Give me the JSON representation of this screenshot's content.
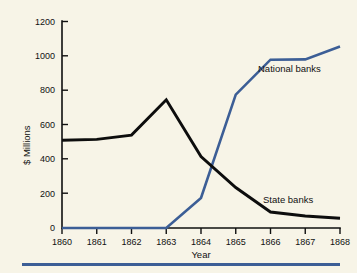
{
  "chart_data": {
    "type": "line",
    "title": "",
    "xlabel": "Year",
    "ylabel": "$ Millions",
    "categories": [
      "1860",
      "1861",
      "1862",
      "1863",
      "1864",
      "1865",
      "1866",
      "1867",
      "1868"
    ],
    "x": [
      1860,
      1861,
      1862,
      1863,
      1864,
      1865,
      1866,
      1867,
      1868
    ],
    "xlim": [
      1860,
      1868
    ],
    "ylim": [
      0,
      1200
    ],
    "yticks": [
      0,
      200,
      400,
      600,
      800,
      1000,
      1200
    ],
    "ytick_labels": [
      "0",
      "200",
      "400",
      "600",
      "800",
      "1000",
      "1200"
    ],
    "grid": false,
    "legend_position": "inline-annotations",
    "series": [
      {
        "name": "State banks",
        "color": "#0d0d0d",
        "values": [
          510,
          515,
          540,
          745,
          415,
          235,
          93,
          70,
          57
        ]
      },
      {
        "name": "National banks",
        "color": "#3c5e96",
        "values": [
          0,
          0,
          0,
          0,
          175,
          775,
          978,
          980,
          1055
        ]
      }
    ],
    "annotations": [
      {
        "text": "National banks",
        "series": "National banks"
      },
      {
        "text": "State banks",
        "series": "State banks"
      }
    ]
  },
  "axes": {
    "y_title": "$ Millions",
    "x_title": "Year",
    "y_tick_labels": [
      "1200",
      "1000",
      "800",
      "600",
      "400",
      "200",
      "0"
    ],
    "x_tick_labels": [
      "1860",
      "1861",
      "1862",
      "1863",
      "1864",
      "1865",
      "1866",
      "1867",
      "1868"
    ]
  },
  "labels": {
    "national_banks": "National banks",
    "state_banks": "State banks"
  },
  "colors": {
    "background": "#f7f4e7",
    "national_banks": "#3c5e96",
    "state_banks": "#0d0d0d",
    "axis": "#101010",
    "bottom_rule": "#3c5e96"
  }
}
